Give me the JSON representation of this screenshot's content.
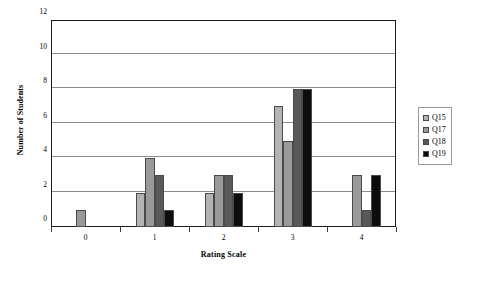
{
  "chart_data": {
    "type": "bar",
    "title": "",
    "xlabel": "Rating Scale",
    "ylabel": "Number of Students",
    "categories": [
      "0",
      "1",
      "2",
      "3",
      "4"
    ],
    "series": [
      {
        "name": "Q15",
        "color": "#b3b3b3",
        "values": [
          0,
          2,
          2,
          7,
          0
        ]
      },
      {
        "name": "Q17",
        "color": "#999999",
        "values": [
          1,
          4,
          3,
          5,
          3
        ]
      },
      {
        "name": "Q18",
        "color": "#595959",
        "values": [
          0,
          3,
          3,
          8,
          1
        ]
      },
      {
        "name": "Q19",
        "color": "#0d0d0d",
        "values": [
          0,
          1,
          2,
          8,
          3
        ]
      }
    ],
    "ylim": [
      0,
      12
    ],
    "yticks": [
      0,
      2,
      4,
      6,
      8,
      10,
      12
    ],
    "ytick_labels": [
      "0",
      "2",
      "4",
      "6",
      "8",
      "10",
      "12"
    ],
    "grid": true,
    "legend_position": "right"
  }
}
